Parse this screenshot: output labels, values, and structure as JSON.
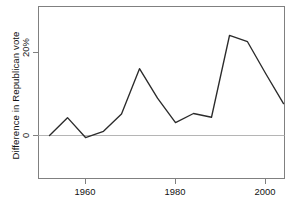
{
  "chart_data": {
    "type": "line",
    "title": "",
    "xlabel": "",
    "ylabel": "Difference in Republican vote",
    "x": [
      1952,
      1956,
      1960,
      1964,
      1968,
      1972,
      1976,
      1980,
      1984,
      1988,
      1992,
      1996,
      2000,
      2004
    ],
    "values": [
      0.0,
      4.3,
      -0.5,
      1.0,
      5.2,
      16.1,
      9.0,
      3.1,
      5.3,
      4.4,
      24.1,
      22.6,
      15.0,
      7.7
    ],
    "series": [
      {
        "name": "Difference in Republican vote",
        "values": [
          0.0,
          4.3,
          -0.5,
          1.0,
          5.2,
          16.1,
          9.0,
          3.1,
          5.3,
          4.4,
          24.1,
          22.6,
          15.0,
          7.7
        ]
      }
    ],
    "xlim": [
      1950,
      1961.5
    ],
    "x_axis_range": [
      1949.5,
      2009.0
    ],
    "ylim": [
      -11.5,
      27.5
    ],
    "yticks": [
      0,
      20
    ],
    "ytick_labels": [
      "0",
      "20%"
    ],
    "xticks": [
      1960,
      1980,
      2000
    ],
    "xtick_labels": [
      "1960",
      "1980",
      "2000"
    ],
    "zero_reference_line": 0,
    "grid": false,
    "legend": null,
    "legend_position": "none",
    "line_color": "#2b2b2b",
    "zero_line_color": "#b0b0b0",
    "axis_color": "#808080",
    "background_color": "#ffffff"
  },
  "axes": {
    "y_tick_0": "0",
    "y_tick_20": "20%",
    "x_tick_1960": "1960",
    "x_tick_1980": "1980",
    "x_tick_2000": "2000",
    "y_axis_title": "Difference in Republican vote"
  }
}
